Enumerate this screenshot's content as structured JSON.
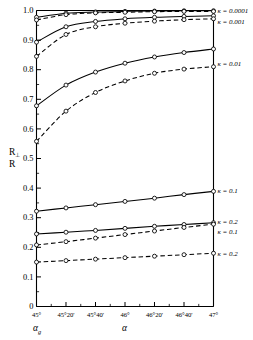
{
  "chart_data": {
    "type": "line",
    "title": "",
    "xlabel": "α",
    "xlabel2": "αg",
    "ylabel": "R⊥ / R",
    "xlim": [
      45.0,
      47.0
    ],
    "ylim": [
      0.0,
      1.0
    ],
    "grid": false,
    "legend_position": "right-of-axes",
    "xticklabels": [
      "45°",
      "45°20'",
      "45°40'",
      "46°",
      "46°20'",
      "46°40'",
      "47°"
    ],
    "xtickvalues": [
      45.0,
      45.3333,
      45.6667,
      46.0,
      46.3333,
      46.6667,
      47.0
    ],
    "yticklabels": [
      "0",
      "0.1",
      "0.2",
      "0.3",
      "0.4",
      "0.5",
      "0.6",
      "0.7",
      "0.8",
      "0.9",
      "1.0"
    ],
    "ytickvalues": [
      0,
      0.1,
      0.2,
      0.3,
      0.4,
      0.5,
      0.6,
      0.7,
      0.8,
      0.9,
      1.0
    ],
    "marker": "open-circle",
    "series": [
      {
        "name": "κ = 0.0001",
        "style": "solid",
        "label": "κ = 0.0001",
        "x": [
          45.0,
          45.3333,
          45.6667,
          46.0,
          46.3333,
          46.6667,
          47.0
        ],
        "values": [
          0.977,
          0.991,
          0.995,
          0.997,
          0.998,
          0.999,
          0.999
        ]
      },
      {
        "name": "κ = 0.0001 (dashed)",
        "style": "dashed",
        "label": "",
        "x": [
          45.0,
          45.3333,
          45.6667,
          46.0,
          46.3333,
          46.6667,
          47.0
        ],
        "values": [
          0.968,
          0.986,
          0.992,
          0.994,
          0.996,
          0.997,
          0.997
        ]
      },
      {
        "name": "κ = 0.001",
        "style": "solid",
        "label": "κ = 0.001",
        "x": [
          45.0,
          45.3333,
          45.6667,
          46.0,
          46.3333,
          46.6667,
          47.0
        ],
        "values": [
          0.893,
          0.945,
          0.963,
          0.972,
          0.977,
          0.98,
          0.982
        ]
      },
      {
        "name": "κ = 0.001 (dashed)",
        "style": "dashed",
        "label": "",
        "x": [
          45.0,
          45.3333,
          45.6667,
          46.0,
          46.3333,
          46.6667,
          47.0
        ],
        "values": [
          0.845,
          0.919,
          0.945,
          0.957,
          0.964,
          0.969,
          0.972
        ]
      },
      {
        "name": "κ = 0.01",
        "style": "solid",
        "label": "κ = 0.01",
        "x": [
          45.0,
          45.3333,
          45.6667,
          46.0,
          46.3333,
          46.6667,
          47.0
        ],
        "values": [
          0.678,
          0.748,
          0.792,
          0.822,
          0.843,
          0.858,
          0.87
        ]
      },
      {
        "name": "κ = 0.01 (dashed)",
        "style": "dashed",
        "label": "",
        "x": [
          45.0,
          45.3333,
          45.6667,
          46.0,
          46.3333,
          46.6667,
          47.0
        ],
        "values": [
          0.558,
          0.66,
          0.723,
          0.762,
          0.788,
          0.802,
          0.81
        ]
      },
      {
        "name": "κ = 0.1",
        "style": "solid",
        "label": "κ = 0.1",
        "x": [
          45.0,
          45.3333,
          45.6667,
          46.0,
          46.3333,
          46.6667,
          47.0
        ],
        "values": [
          0.322,
          0.333,
          0.344,
          0.355,
          0.366,
          0.378,
          0.389
        ]
      },
      {
        "name": "κ = 0.2",
        "style": "solid",
        "label": "κ = 0.2",
        "x": [
          45.0,
          45.3333,
          45.6667,
          46.0,
          46.3333,
          46.6667,
          47.0
        ],
        "values": [
          0.245,
          0.251,
          0.257,
          0.264,
          0.271,
          0.277,
          0.283
        ]
      },
      {
        "name": "κ = 0.1 (dashed)",
        "style": "dashed",
        "label": "κ = 0.1",
        "x": [
          45.0,
          45.3333,
          45.6667,
          46.0,
          46.3333,
          46.6667,
          47.0
        ],
        "values": [
          0.208,
          0.219,
          0.231,
          0.243,
          0.255,
          0.267,
          0.278
        ]
      },
      {
        "name": "κ = 0.2 (dashed)",
        "style": "dashed",
        "label": "κ = 0.2",
        "x": [
          45.0,
          45.3333,
          45.6667,
          46.0,
          46.3333,
          46.6667,
          47.0
        ],
        "values": [
          0.15,
          0.155,
          0.16,
          0.165,
          0.17,
          0.175,
          0.18
        ]
      }
    ],
    "annotations": [
      {
        "text": "κ = 0.0001",
        "y": 0.998
      },
      {
        "text": "κ = 0.001",
        "y": 0.962
      },
      {
        "text": "κ = 0.01",
        "y": 0.82
      },
      {
        "text": "κ = 0.1",
        "y": 0.39
      },
      {
        "text": "κ = 0.2",
        "y": 0.288
      },
      {
        "text": "κ = 0.1",
        "y": 0.252
      },
      {
        "text": "κ = 0.2",
        "y": 0.18
      }
    ]
  },
  "axes": {
    "ylabel_top": "R",
    "ylabel_top_sub": "⊥",
    "ylabel_bottom": "R",
    "xlabel_left": "α",
    "xlabel_left_sub": "g",
    "xlabel_center": "α"
  },
  "colors": {
    "line": "#000000",
    "axis": "#000000",
    "background": "#ffffff"
  }
}
